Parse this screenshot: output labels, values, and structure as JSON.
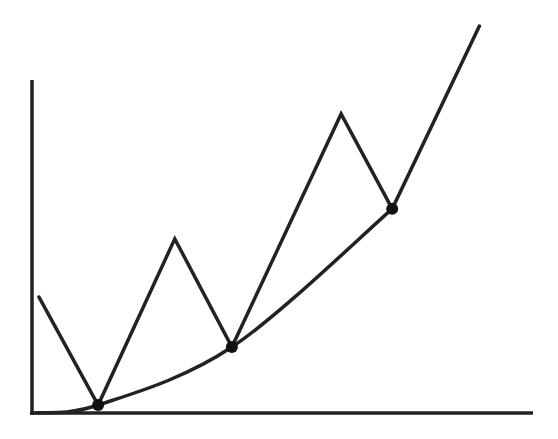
{
  "diagram": {
    "colors": {
      "stroke": "#222222",
      "dot": "#111111",
      "background": "#ffffff"
    },
    "axes": {
      "x_label": "",
      "y_label": "",
      "ticks": false
    },
    "domain": {
      "x": [
        0,
        100
      ],
      "y": [
        0,
        100
      ]
    },
    "zigzag_points": [
      [
        1.4,
        34.8
      ],
      [
        13.2,
        2.4
      ],
      [
        28.5,
        52.3
      ],
      [
        39.9,
        19.8
      ],
      [
        61.7,
        89.8
      ],
      [
        71.9,
        61.3
      ],
      [
        89.3,
        116.2
      ]
    ],
    "curve": {
      "type": "convex-increasing",
      "points": [
        [
          0.6,
          0
        ],
        [
          13.2,
          2.4
        ],
        [
          39.9,
          19.8
        ],
        [
          71.9,
          61.3
        ]
      ]
    },
    "contact_points": [
      [
        13.2,
        2.4
      ],
      [
        39.9,
        19.8
      ],
      [
        71.9,
        61.3
      ]
    ]
  }
}
